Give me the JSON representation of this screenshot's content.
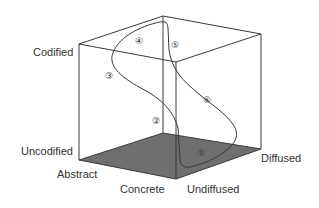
{
  "diagram": {
    "type": "3d-cube-information-space",
    "colors": {
      "line": "#3a3a3a",
      "floor": "#6f6f6f",
      "background": "#ffffff",
      "text": "#333333"
    },
    "axes": {
      "codification": {
        "high": "Codified",
        "low": "Uncodified"
      },
      "abstraction": {
        "high": "Abstract",
        "low": "Concrete"
      },
      "diffusion": {
        "low": "Undiffused",
        "high": "Diffused"
      }
    },
    "markers": [
      {
        "id": 1,
        "glyph": "①"
      },
      {
        "id": 2,
        "glyph": "②"
      },
      {
        "id": 3,
        "glyph": "③"
      },
      {
        "id": 4,
        "glyph": "④"
      },
      {
        "id": 5,
        "glyph": "⑤"
      },
      {
        "id": 6,
        "glyph": "⑥"
      }
    ]
  }
}
